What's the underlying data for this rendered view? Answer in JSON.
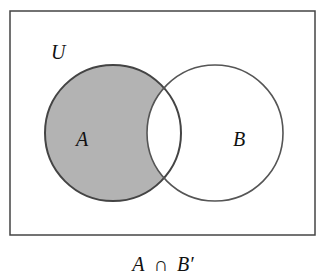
{
  "diagram": {
    "type": "venn",
    "universe_label": "U",
    "sets": [
      {
        "label": "A",
        "shaded": "only-A"
      },
      {
        "label": "B",
        "shaded": "none"
      }
    ],
    "caption": {
      "left": "A",
      "op": "∩",
      "right": "B′"
    },
    "colors": {
      "shade": "#b3b3b3",
      "stroke": "#444444",
      "stroke_b": "#555555",
      "background": "#ffffff"
    }
  }
}
